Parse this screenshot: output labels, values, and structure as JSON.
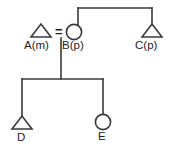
{
  "figure": {
    "kind": "pedigree-chart",
    "stroke_color": "#3a3a3a",
    "text_color": "#1d1d1d",
    "background": "#ffffff",
    "mating_symbol": "=",
    "symbol_legend": {
      "triangle": "male",
      "circle": "female"
    }
  },
  "individuals": [
    {
      "id": "A",
      "label": "A(m)",
      "shape": "triangle",
      "generation": 1,
      "cx": 41,
      "cy": 31
    },
    {
      "id": "B",
      "label": "B(p)",
      "shape": "circle",
      "generation": 1,
      "cx": 74,
      "cy": 32
    },
    {
      "id": "C",
      "label": "C(p)",
      "shape": "triangle",
      "generation": 1,
      "cx": 152,
      "cy": 31
    },
    {
      "id": "D",
      "label": "D",
      "shape": "triangle",
      "generation": 2,
      "cx": 22,
      "cy": 123
    },
    {
      "id": "E",
      "label": "E",
      "shape": "circle",
      "generation": 2,
      "cx": 103,
      "cy": 122
    }
  ],
  "relationships": [
    {
      "type": "mating",
      "partners": [
        "A",
        "B"
      ]
    },
    {
      "type": "sibship",
      "members": [
        "B",
        "C"
      ]
    },
    {
      "type": "offspring",
      "parents": [
        "A",
        "B"
      ],
      "children": [
        "D",
        "E"
      ]
    }
  ]
}
